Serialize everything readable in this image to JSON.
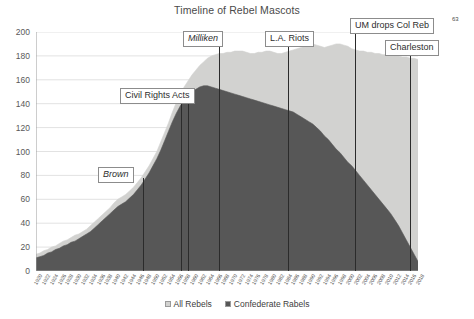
{
  "chart_data": {
    "type": "area",
    "title": "Timeline of Rebel Mascots",
    "xlabel": "",
    "ylabel": "",
    "ylim": [
      0,
      200
    ],
    "ytick_step": 20,
    "yticks": [
      "0",
      "20",
      "40",
      "60",
      "80",
      "100",
      "120",
      "140",
      "160",
      "180",
      "200"
    ],
    "grid": "horizontal",
    "legend_position": "bottom-center",
    "stacked": "overlapping",
    "colors": {
      "all_rebels": "#D2D2D0",
      "confederate_rabels": "#575757",
      "gridline": "#E2E2E2",
      "annotation_line": "#2b2b2b",
      "annotation_border": "#8c8c8c"
    },
    "x": [
      "1920",
      "1921",
      "1922",
      "1923",
      "1924",
      "1925",
      "1926",
      "1927",
      "1928",
      "1929",
      "1930",
      "1931",
      "1932",
      "1933",
      "1934",
      "1935",
      "1936",
      "1937",
      "1938",
      "1939",
      "1940",
      "1941",
      "1942",
      "1943",
      "1944",
      "1945",
      "1946",
      "1947",
      "1948",
      "1949",
      "1950",
      "1951",
      "1952",
      "1953",
      "1954",
      "1955",
      "1956",
      "1957",
      "1958",
      "1959",
      "1960",
      "1961",
      "1962",
      "1963",
      "1964",
      "1965",
      "1966",
      "1967",
      "1968",
      "1969",
      "1970",
      "1971",
      "1972",
      "1973",
      "1974",
      "1975",
      "1976",
      "1977",
      "1978",
      "1979",
      "1980",
      "1981",
      "1982",
      "1983",
      "1984",
      "1985",
      "1986",
      "1987",
      "1988",
      "1989",
      "1990",
      "1991",
      "1992",
      "1993",
      "1994",
      "1995",
      "1996",
      "1997",
      "1998",
      "1999",
      "2000",
      "2001",
      "2002",
      "2003",
      "2004",
      "2005",
      "2006",
      "2007",
      "2008",
      "2009",
      "2010",
      "2011",
      "2012",
      "2013",
      "2014",
      "2015",
      "2016",
      "2017",
      "2018"
    ],
    "xtick_labels": [
      "1920",
      "1922",
      "1924",
      "1926",
      "1928",
      "1930",
      "1932",
      "1934",
      "1936",
      "1938",
      "1940",
      "1942",
      "1944",
      "1946",
      "1948",
      "1950",
      "1952",
      "1954",
      "1956",
      "1958",
      "1960",
      "1962",
      "1964",
      "1966",
      "1968",
      "1970",
      "1972",
      "1974",
      "1976",
      "1978",
      "1980",
      "1982",
      "1984",
      "1986",
      "1988",
      "1990",
      "1992",
      "1994",
      "1996",
      "1998",
      "2000",
      "2002",
      "2004",
      "2006",
      "2008",
      "2010",
      "2012",
      "2014",
      "2016",
      "2018"
    ],
    "series": [
      {
        "name": "All Rebels",
        "color": "#D2D2D0",
        "values": [
          14,
          15,
          17,
          18,
          20,
          21,
          23,
          25,
          26,
          28,
          30,
          31,
          33,
          35,
          38,
          41,
          44,
          47,
          50,
          53,
          57,
          60,
          62,
          64,
          67,
          70,
          74,
          78,
          83,
          88,
          94,
          100,
          108,
          116,
          124,
          133,
          141,
          148,
          154,
          159,
          164,
          168,
          172,
          175,
          178,
          180,
          181,
          182,
          182,
          183,
          183,
          184,
          184,
          184,
          183,
          182,
          182,
          183,
          183,
          184,
          184,
          183,
          182,
          182,
          183,
          184,
          185,
          186,
          187,
          188,
          189,
          190,
          189,
          188,
          187,
          188,
          189,
          190,
          190,
          189,
          188,
          186,
          185,
          184,
          184,
          183,
          183,
          182,
          182,
          181,
          181,
          180,
          180,
          180,
          179,
          179,
          178,
          178,
          177
        ]
      },
      {
        "name": "Confederate Rabels",
        "color": "#575757",
        "values": [
          11,
          12,
          13,
          15,
          16,
          18,
          19,
          21,
          22,
          24,
          25,
          27,
          29,
          31,
          33,
          36,
          39,
          42,
          45,
          48,
          51,
          54,
          56,
          58,
          61,
          64,
          68,
          72,
          77,
          82,
          88,
          94,
          101,
          109,
          117,
          125,
          132,
          138,
          143,
          147,
          150,
          152,
          154,
          155,
          155,
          154,
          153,
          152,
          151,
          150,
          149,
          148,
          147,
          146,
          145,
          144,
          143,
          142,
          141,
          140,
          139,
          138,
          137,
          136,
          135,
          134,
          133,
          131,
          129,
          127,
          125,
          123,
          120,
          117,
          113,
          110,
          106,
          102,
          99,
          95,
          91,
          88,
          84,
          80,
          76,
          72,
          68,
          64,
          60,
          56,
          52,
          48,
          43,
          38,
          32,
          26,
          20,
          14,
          8
        ]
      }
    ],
    "annotations": [
      {
        "label": "Brown",
        "italic": true,
        "year": "1954",
        "box_left": 98,
        "box_top": 167,
        "line_top": 178,
        "line_bottom": 271,
        "line_x": 143
      },
      {
        "label": "Civil Rights Acts",
        "italic": false,
        "year": "1964",
        "box_left": 120,
        "box_top": 88,
        "line_top": 101,
        "line_bottom": 271,
        "line_x": 181,
        "line_x2": 188
      },
      {
        "label": "Milliken",
        "italic": true,
        "year": "1974",
        "box_left": 183,
        "box_top": 31,
        "line_top": 44,
        "line_bottom": 271,
        "line_x": 219
      },
      {
        "label": "L.A. Riots",
        "italic": false,
        "year": "1992",
        "box_left": 265,
        "box_top": 31,
        "line_top": 44,
        "line_bottom": 271,
        "line_x": 288
      },
      {
        "label": "UM drops Col Reb",
        "italic": false,
        "year": "2003",
        "box_left": 350,
        "box_top": 18,
        "line_top": 31,
        "line_bottom": 271,
        "line_x": 355
      },
      {
        "label": "Charleston",
        "italic": false,
        "year": "2015",
        "box_left": 385,
        "box_top": 40,
        "line_top": 53,
        "line_bottom": 271,
        "line_x": 410
      }
    ],
    "superscript_note": "63"
  }
}
